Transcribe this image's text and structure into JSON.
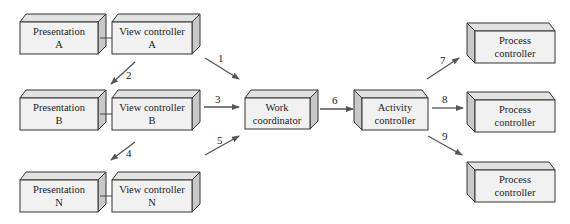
{
  "diagram": {
    "boxes": [
      {
        "id": "presentation-a",
        "line1": "Presentation",
        "line2": "A"
      },
      {
        "id": "view-controller-a",
        "line1": "View controller",
        "line2": "A"
      },
      {
        "id": "presentation-b",
        "line1": "Presentation",
        "line2": "B"
      },
      {
        "id": "view-controller-b",
        "line1": "View controller",
        "line2": "B"
      },
      {
        "id": "presentation-n",
        "line1": "Presentation",
        "line2": "N"
      },
      {
        "id": "view-controller-n",
        "line1": "View controller",
        "line2": "N"
      },
      {
        "id": "work-coordinator",
        "line1": "Work",
        "line2": "coordinator"
      },
      {
        "id": "activity-controller",
        "line1": "Activity",
        "line2": "controller"
      },
      {
        "id": "process-controller-1",
        "line1": "Process",
        "line2": "controller"
      },
      {
        "id": "process-controller-2",
        "line1": "Process",
        "line2": "controller"
      },
      {
        "id": "process-controller-3",
        "line1": "Process",
        "line2": "controller"
      }
    ],
    "arrows": [
      {
        "label": "1",
        "from": "view-controller-a",
        "to": "work-coordinator"
      },
      {
        "label": "2",
        "from": "view-controller-a",
        "to": "presentation-b"
      },
      {
        "label": "3",
        "from": "view-controller-b",
        "to": "work-coordinator"
      },
      {
        "label": "4",
        "from": "view-controller-b",
        "to": "presentation-n"
      },
      {
        "label": "5",
        "from": "view-controller-n",
        "to": "work-coordinator"
      },
      {
        "label": "6",
        "from": "work-coordinator",
        "to": "activity-controller"
      },
      {
        "label": "7",
        "from": "activity-controller",
        "to": "process-controller-1"
      },
      {
        "label": "8",
        "from": "activity-controller",
        "to": "process-controller-2"
      },
      {
        "label": "9",
        "from": "activity-controller",
        "to": "process-controller-3"
      }
    ]
  }
}
